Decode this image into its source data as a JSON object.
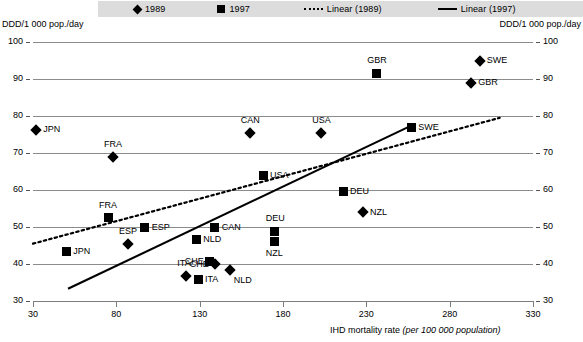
{
  "legend": {
    "items": [
      {
        "name": "marker-1989",
        "label": "1989",
        "glyph": "diamond"
      },
      {
        "name": "marker-1997",
        "label": "1997",
        "glyph": "square"
      },
      {
        "name": "trend-1989",
        "label": "Linear (1989)",
        "glyph": "dotted-line"
      },
      {
        "name": "trend-1997",
        "label": "Linear (1997)",
        "glyph": "solid-line"
      }
    ]
  },
  "axis": {
    "y_caption_left": "DDD/1 000 pop./day",
    "y_caption_right": "DDD/1 000 pop./day",
    "x_caption_main": "IHD mortality rate ",
    "x_caption_italic": "(per 100 000 population)",
    "y_ticks": [
      "100",
      "90",
      "80",
      "70",
      "60",
      "50",
      "40",
      "30"
    ],
    "x_ticks": [
      "30",
      "80",
      "130",
      "180",
      "230",
      "280",
      "330"
    ]
  },
  "chart_data": {
    "type": "scatter",
    "title": "",
    "xlabel": "IHD mortality rate (per 100 000 population)",
    "ylabel": "DDD/1 000 pop./day",
    "xlim": [
      30,
      330
    ],
    "ylim": [
      30,
      100
    ],
    "xticks": [
      30,
      80,
      130,
      180,
      230,
      280,
      330
    ],
    "yticks": [
      30,
      40,
      50,
      60,
      70,
      80,
      90,
      100
    ],
    "grid": "horizontal",
    "legend_position": "top",
    "series": [
      {
        "name": "1989",
        "marker": "diamond",
        "points": [
          {
            "label": "JPN",
            "x": 32,
            "y": 76.3,
            "label_pos": "right"
          },
          {
            "label": "FRA",
            "x": 78,
            "y": 68.8,
            "label_pos": "above"
          },
          {
            "label": "ESP",
            "x": 87,
            "y": 45.5,
            "label_pos": "above"
          },
          {
            "label": "ITA",
            "x": 122,
            "y": 36.8,
            "label_pos": "above"
          },
          {
            "label": "CHE",
            "x": 139,
            "y": 40.0,
            "label_pos": "left"
          },
          {
            "label": "NLD",
            "x": 148,
            "y": 38.5,
            "label_pos": "below-right"
          },
          {
            "label": "CAN",
            "x": 160,
            "y": 75.5,
            "label_pos": "above"
          },
          {
            "label": "USA",
            "x": 203,
            "y": 75.5,
            "label_pos": "above"
          },
          {
            "label": "NZL",
            "x": 228,
            "y": 54.0,
            "label_pos": "right"
          },
          {
            "label": "SWE",
            "x": 298,
            "y": 95.0,
            "label_pos": "right"
          },
          {
            "label": "GBR",
            "x": 293,
            "y": 89.0,
            "label_pos": "right"
          }
        ]
      },
      {
        "name": "1997",
        "marker": "square",
        "points": [
          {
            "label": "JPN",
            "x": 50,
            "y": 43.5,
            "label_pos": "right"
          },
          {
            "label": "FRA",
            "x": 75,
            "y": 52.5,
            "label_pos": "above"
          },
          {
            "label": "ESP",
            "x": 97,
            "y": 50.0,
            "label_pos": "right"
          },
          {
            "label": "NLD",
            "x": 128,
            "y": 46.5,
            "label_pos": "right"
          },
          {
            "label": "ITA",
            "x": 129,
            "y": 35.8,
            "label_pos": "right"
          },
          {
            "label": "CHE",
            "x": 136,
            "y": 40.8,
            "label_pos": "left"
          },
          {
            "label": "CAN",
            "x": 139,
            "y": 50.0,
            "label_pos": "right"
          },
          {
            "label": "DEU",
            "x": 175,
            "y": 48.8,
            "label_pos": "above"
          },
          {
            "label": "NZL",
            "x": 175,
            "y": 46.0,
            "label_pos": "below"
          },
          {
            "label": "USA",
            "x": 168,
            "y": 64.0,
            "label_pos": "right"
          },
          {
            "label": "DEU",
            "x": 216,
            "y": 59.5,
            "label_pos": "right"
          },
          {
            "label": "SWE",
            "x": 257,
            "y": 77.0,
            "label_pos": "right"
          },
          {
            "label": "GBR",
            "x": 236,
            "y": 91.5,
            "label_pos": "above"
          }
        ]
      }
    ],
    "trendlines": [
      {
        "name": "Linear (1989)",
        "style": "dotted",
        "x0": 30,
        "y0": 45.5,
        "x1": 310,
        "y1": 79.5
      },
      {
        "name": "Linear (1997)",
        "style": "solid",
        "x0": 51,
        "y0": 33.3,
        "x1": 256,
        "y1": 77.2
      }
    ]
  }
}
